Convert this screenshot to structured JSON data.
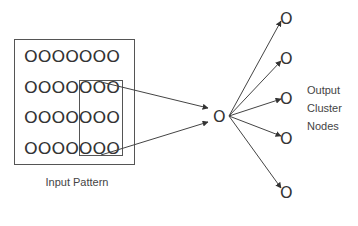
{
  "diagram": {
    "type": "neural-network-cluster-diagram",
    "input_pattern": {
      "label": "Input Pattern",
      "rows": [
        "OOOOOOO",
        "OOOOOOO",
        "OOOOOOO",
        "OOOOOOO"
      ],
      "grid_size": {
        "rows": 4,
        "cols": 7
      },
      "receptive_field": {
        "rows": "2-4",
        "cols": "5-7",
        "highlighted": true
      }
    },
    "center_node": {
      "glyph": "O"
    },
    "output_nodes": [
      {
        "glyph": "O"
      },
      {
        "glyph": "O"
      },
      {
        "glyph": "O"
      },
      {
        "glyph": "O"
      },
      {
        "glyph": "O"
      }
    ],
    "output_label": {
      "lines": [
        "Output",
        "Cluster",
        "Nodes"
      ]
    },
    "colors": {
      "stroke": "#444444",
      "node": "#333333",
      "background": "#ffffff"
    }
  }
}
